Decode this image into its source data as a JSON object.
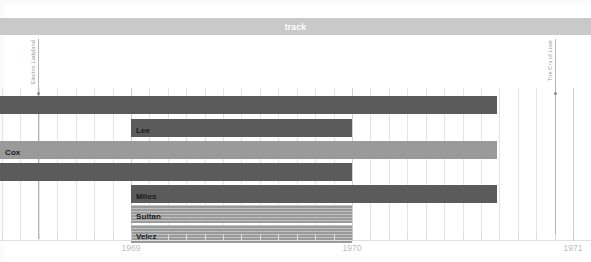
{
  "section": {
    "label": "track"
  },
  "axis": {
    "years": [
      "1969",
      "1970",
      "1971"
    ],
    "year_positions": [
      131,
      352,
      573
    ],
    "month_count": 24,
    "start_year": 1969,
    "end_year": 1971
  },
  "markers": [
    {
      "label": "Electric Ladyland",
      "x": 38
    },
    {
      "label": "The Cry of Love",
      "x": 555
    }
  ],
  "rows": [
    {
      "label": "",
      "name": "bar-row-unlabeled-1",
      "x": 0,
      "width": 497,
      "y": 96,
      "color": "#5b5b5b",
      "striped": false
    },
    {
      "label": "Lee",
      "name": "bar-row-lee",
      "x": 131,
      "width": 221,
      "y": 119,
      "color": "#5b5b5b",
      "striped": false
    },
    {
      "label": "Cox",
      "name": "bar-row-cox",
      "x": 0,
      "width": 497,
      "y": 141,
      "color": "#9a9a9a",
      "striped": false
    },
    {
      "label": "",
      "name": "bar-row-unlabeled-2",
      "x": 0,
      "width": 352,
      "y": 163,
      "color": "#5b5b5b",
      "striped": false
    },
    {
      "label": "Miles",
      "name": "bar-row-miles",
      "x": 131,
      "width": 366,
      "y": 185,
      "color": "#5b5b5b",
      "striped": false
    },
    {
      "label": "Sultan",
      "name": "bar-row-sultan",
      "x": 131,
      "width": 221,
      "y": 205,
      "color": "#9a9a9a",
      "striped": true
    },
    {
      "label": "Velez",
      "name": "bar-row-velez",
      "x": 131,
      "width": 221,
      "y": 225,
      "color": "#9a9a9a",
      "striped": true
    }
  ],
  "colors": {
    "band": "#c9c9c9",
    "bar_dark": "#5b5b5b",
    "bar_light": "#9a9a9a",
    "grid": "#e4e4e4",
    "axis_text": "#bdbdbd",
    "marker": "#b4b4b4"
  },
  "chart_data": {
    "type": "bar",
    "title": "track",
    "xlabel": "",
    "ylabel": "",
    "orientation": "horizontal",
    "grid": true,
    "legend_position": "none",
    "xlim": [
      1969.0,
      1971.0
    ],
    "x_tick_labels": [
      "1969",
      "1970",
      "1971"
    ],
    "categories": [
      "",
      "Lee",
      "Cox",
      "",
      "Miles",
      "Sultan",
      "Velez"
    ],
    "series": [
      {
        "name": "tenure",
        "intervals": [
          {
            "category": "",
            "start": 1968.41,
            "end": 1971.9,
            "color": "#5b5b5b"
          },
          {
            "category": "Lee",
            "start": 1969.0,
            "end": 1970.0,
            "color": "#5b5b5b"
          },
          {
            "category": "Cox",
            "start": 1968.41,
            "end": 1971.9,
            "color": "#9a9a9a"
          },
          {
            "category": "",
            "start": 1968.41,
            "end": 1970.0,
            "color": "#5b5b5b"
          },
          {
            "category": "Miles",
            "start": 1969.0,
            "end": 1970.66,
            "color": "#5b5b5b"
          },
          {
            "category": "Sultan",
            "start": 1969.0,
            "end": 1970.0,
            "color": "#9a9a9a"
          },
          {
            "category": "Velez",
            "start": 1969.0,
            "end": 1970.0,
            "color": "#9a9a9a"
          }
        ]
      }
    ],
    "annotations": [
      {
        "label": "Electric Ladyland",
        "x": 1968.58
      },
      {
        "label": "The Cry of Love",
        "x": 1970.92
      }
    ]
  }
}
